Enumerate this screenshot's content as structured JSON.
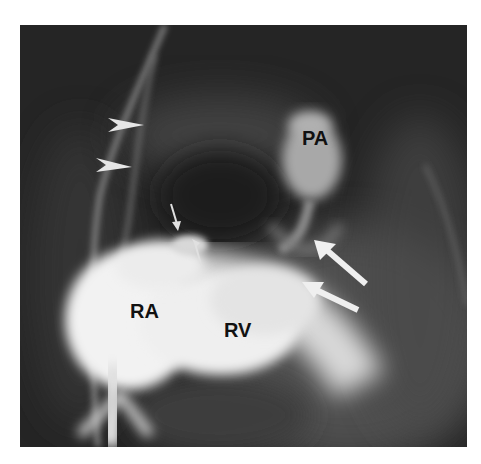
{
  "figure": {
    "type": "angiogram",
    "background_color": "#ffffff",
    "image_bg_color": "#1e1e1e",
    "labels": [
      {
        "id": "pa",
        "text": "PA",
        "x": 302,
        "y": 125
      },
      {
        "id": "ra",
        "text": "RA",
        "x": 130,
        "y": 298
      },
      {
        "id": "rv",
        "text": "RV",
        "x": 223,
        "y": 317
      }
    ],
    "arrows": [
      {
        "id": "arrowhead-1",
        "kind": "arrowhead-large",
        "x": 108,
        "y": 118
      },
      {
        "id": "arrowhead-2",
        "kind": "arrowhead-large",
        "x": 96,
        "y": 158
      },
      {
        "id": "arrow-small-1",
        "kind": "arrow-small",
        "x": 174,
        "y": 208
      },
      {
        "id": "arrow-small-2",
        "kind": "arrow-small",
        "x": 193,
        "y": 243
      },
      {
        "id": "arrow-large-1",
        "kind": "arrow-large",
        "x": 316,
        "y": 242
      },
      {
        "id": "arrow-large-2",
        "kind": "arrow-large",
        "x": 303,
        "y": 280
      }
    ]
  }
}
